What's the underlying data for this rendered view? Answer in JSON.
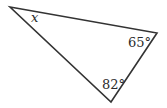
{
  "diagram": {
    "type": "triangle",
    "angles": {
      "top_left": "x",
      "right": "65°",
      "bottom": "82°"
    },
    "colors": {
      "stroke": "#333333",
      "background": "#ffffff"
    }
  }
}
